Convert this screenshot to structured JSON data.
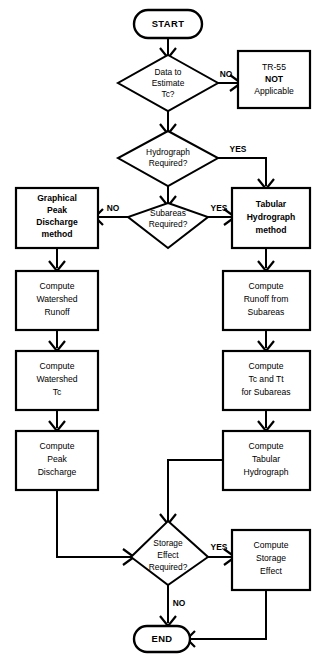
{
  "diagram": {
    "type": "flowchart",
    "colors": {
      "background": "#ffffff",
      "stroke": "#000000",
      "fill": "#ffffff"
    },
    "nodes": {
      "start": {
        "label": "START",
        "shape": "terminal"
      },
      "data_tc": {
        "line1": "Data to",
        "line2": "Estimate",
        "line3": "Tc?",
        "shape": "decision"
      },
      "tr55_not": {
        "line1": "TR-55",
        "line2": "NOT",
        "line3": "Applicable",
        "shape": "process"
      },
      "hydrograph_req": {
        "line1": "Hydrograph",
        "line2": "Required?",
        "shape": "decision"
      },
      "subareas_req": {
        "line1": "Subareas",
        "line2": "Required?",
        "shape": "decision"
      },
      "graphical_peak": {
        "line1": "Graphical",
        "line2": "Peak",
        "line3": "Discharge",
        "line4": "method",
        "shape": "process"
      },
      "tabular_hydro": {
        "line1": "Tabular",
        "line2": "Hydrograph",
        "line3": "method",
        "shape": "process"
      },
      "compute_ws_runoff": {
        "line1": "Compute",
        "line2": "Watershed",
        "line3": "Runoff",
        "shape": "process"
      },
      "compute_ws_tc": {
        "line1": "Compute",
        "line2": "Watershed",
        "line3": "Tc",
        "shape": "process"
      },
      "compute_peak_discharge": {
        "line1": "Compute",
        "line2": "Peak",
        "line3": "Discharge",
        "shape": "process"
      },
      "compute_runoff_sub": {
        "line1": "Compute",
        "line2": "Runoff from",
        "line3": "Subareas",
        "shape": "process"
      },
      "compute_tc_tt": {
        "line1": "Compute",
        "line2": "Tc and Tt",
        "line3": "for Subareas",
        "shape": "process"
      },
      "compute_tabular": {
        "line1": "Compute",
        "line2": "Tabular",
        "line3": "Hydrograph",
        "shape": "process"
      },
      "storage_req": {
        "line1": "Storage",
        "line2": "Effect",
        "line3": "Required?",
        "shape": "decision"
      },
      "compute_storage": {
        "line1": "Compute",
        "line2": "Storage",
        "line3": "Effect",
        "shape": "process"
      },
      "end": {
        "label": "END",
        "shape": "terminal"
      }
    },
    "edge_labels": {
      "data_tc_no": "NO",
      "hydrograph_yes": "YES",
      "subareas_no": "NO",
      "subareas_yes": "YES",
      "storage_yes": "YES",
      "storage_no": "NO"
    }
  }
}
